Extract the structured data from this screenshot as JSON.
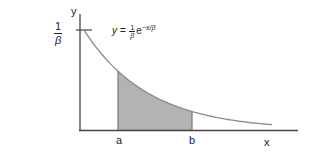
{
  "chart_data": {
    "type": "area",
    "title": "",
    "xlabel": "x",
    "ylabel": "y",
    "equation": "y = (1/β) e^(−x/β)",
    "y_tick_label": "1/β",
    "curve": "exponential decay starting at y = 1/β when x = 0",
    "shaded_region": {
      "from": "a",
      "to": "b",
      "fill": "#b3b3b3"
    },
    "x_markers": [
      "a",
      "b"
    ],
    "grid": false,
    "legend": null
  },
  "labels": {
    "y_axis": "y",
    "x_axis": "x",
    "y_tick_num": "1",
    "y_tick_den": "β",
    "eq_lhs": "y = ",
    "eq_num": "1",
    "eq_den": "β",
    "eq_e": "e",
    "eq_exp": "−x/β",
    "marker_a": "a",
    "marker_b": "b"
  },
  "colors": {
    "axis": "#444444",
    "curve": "#8a8a8a",
    "shade": "#b3b3b3"
  }
}
